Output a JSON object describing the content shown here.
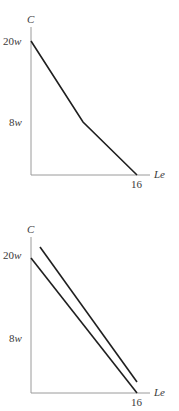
{
  "diagrams": [
    {
      "y_axis_label": "C",
      "x_axis_label": "Le",
      "y_ticks": [
        {
          "label_num": "20",
          "label_var": "w"
        },
        {
          "label_num": "8",
          "label_var": "w"
        }
      ],
      "x_ticks": [
        {
          "label": "16"
        }
      ],
      "lines": [
        {
          "name": "budget-constraint-kinked",
          "points": [
            [
              0,
              "20w"
            ],
            [
              "kink",
              "8w"
            ],
            [
              16,
              0
            ]
          ]
        }
      ]
    },
    {
      "y_axis_label": "C",
      "x_axis_label": "Le",
      "y_ticks": [
        {
          "label_num": "20",
          "label_var": "w"
        },
        {
          "label_num": "8",
          "label_var": "w"
        }
      ],
      "x_ticks": [
        {
          "label": "16"
        }
      ],
      "lines": [
        {
          "name": "budget-line-original",
          "points": [
            [
              0,
              "20w"
            ],
            [
              16,
              0
            ]
          ]
        },
        {
          "name": "budget-line-steeper",
          "passes_through": "8w point"
        }
      ]
    }
  ]
}
